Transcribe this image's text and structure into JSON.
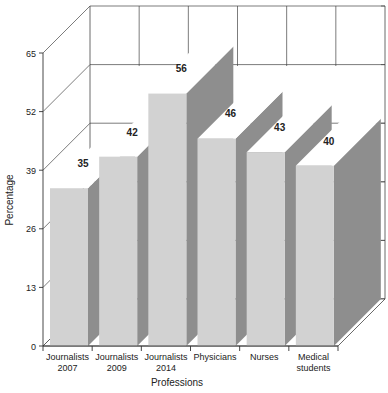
{
  "chart_data": {
    "type": "bar",
    "title": "",
    "xlabel": "Professions",
    "ylabel": "Percentage",
    "ylim": [
      0,
      65
    ],
    "yticks": [
      0,
      13,
      26,
      39,
      52,
      65
    ],
    "grid": true,
    "legend": null,
    "style": "3d",
    "categories": [
      [
        "Journalists",
        "2007"
      ],
      [
        "Journalists",
        "2009"
      ],
      [
        "Journalists",
        "2014"
      ],
      [
        "Physicians"
      ],
      [
        "Nurses"
      ],
      [
        "Medical",
        "students"
      ]
    ],
    "values": [
      35,
      42,
      56,
      46,
      43,
      40
    ],
    "data_labels": [
      "35",
      "42",
      "56",
      "46",
      "43",
      "40"
    ]
  },
  "colors": {
    "bar_front": "#d2d2d2",
    "bar_side": "#8e8e8e",
    "bar_top": "#ffffff",
    "axis": "#333333",
    "grid": "#444444",
    "text": "#222222"
  }
}
